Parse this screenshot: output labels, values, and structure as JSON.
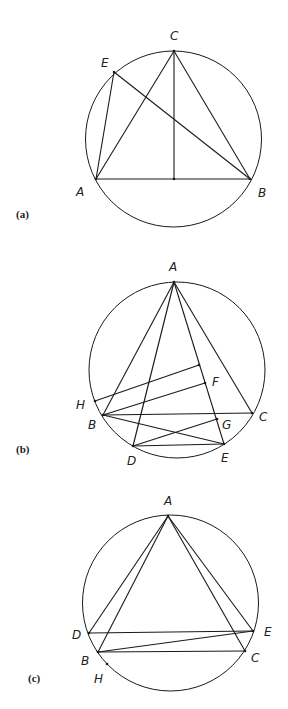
{
  "panels": [
    {
      "caption": "(a)",
      "circle": {
        "cx": 173.5,
        "cy": 139,
        "r": 88
      },
      "points": {
        "A": [
          96,
          179
        ],
        "B": [
          250,
          179
        ],
        "C": [
          174,
          51
        ],
        "E": [
          114,
          72
        ],
        "F": [
          174,
          179
        ]
      },
      "labels": [
        {
          "text": "C",
          "x": 170,
          "y": 40
        },
        {
          "text": "E",
          "x": 101,
          "y": 67
        },
        {
          "text": "A",
          "x": 76,
          "y": 196
        },
        {
          "text": "B",
          "x": 258,
          "y": 197
        }
      ],
      "segments": [
        [
          "A",
          "B"
        ],
        [
          "A",
          "C"
        ],
        [
          "B",
          "C"
        ],
        [
          "C",
          "F"
        ],
        [
          "A",
          "E"
        ],
        [
          "E",
          "B"
        ]
      ],
      "caption_pos": {
        "x": 16,
        "y": 218
      }
    },
    {
      "caption": "(b)",
      "circle": {
        "cx": 177,
        "cy": 370,
        "r": 88
      },
      "points": {
        "A": [
          174,
          282
        ],
        "B": [
          103,
          415
        ],
        "C": [
          252,
          413
        ],
        "D": [
          133,
          446
        ],
        "E": [
          224,
          444
        ],
        "H": [
          95,
          401
        ],
        "P": [
          199,
          365
        ],
        "F": [
          205,
          383
        ],
        "G": [
          217,
          419
        ]
      },
      "labels": [
        {
          "text": "A",
          "x": 169,
          "y": 271
        },
        {
          "text": "F",
          "x": 212,
          "y": 386
        },
        {
          "text": "H",
          "x": 76,
          "y": 409
        },
        {
          "text": "C",
          "x": 259,
          "y": 421
        },
        {
          "text": "B",
          "x": 88,
          "y": 429
        },
        {
          "text": "G",
          "x": 222,
          "y": 429
        },
        {
          "text": "D",
          "x": 127,
          "y": 465
        },
        {
          "text": "E",
          "x": 221,
          "y": 462
        }
      ],
      "segments": [
        [
          "A",
          "B"
        ],
        [
          "A",
          "C"
        ],
        [
          "A",
          "D"
        ],
        [
          "A",
          "E"
        ],
        [
          "B",
          "C"
        ],
        [
          "D",
          "E"
        ],
        [
          "B",
          "E"
        ],
        [
          "D",
          "G"
        ],
        [
          "H",
          "P"
        ],
        [
          "B",
          "F"
        ]
      ],
      "caption_pos": {
        "x": 16,
        "y": 453
      }
    },
    {
      "caption": "(c)",
      "circle": {
        "cx": 170.5,
        "cy": 603,
        "r": 88
      },
      "points": {
        "A": [
          168,
          516
        ],
        "D": [
          89,
          633
        ],
        "E": [
          253,
          631
        ],
        "B": [
          98,
          652
        ],
        "C": [
          245,
          651
        ],
        "H": [
          107,
          664
        ]
      },
      "labels": [
        {
          "text": "A",
          "x": 164,
          "y": 505
        },
        {
          "text": "D",
          "x": 72,
          "y": 639
        },
        {
          "text": "E",
          "x": 264,
          "y": 636
        },
        {
          "text": "B",
          "x": 81,
          "y": 665
        },
        {
          "text": "C",
          "x": 251,
          "y": 662
        },
        {
          "text": "H",
          "x": 94,
          "y": 683
        }
      ],
      "segments": [
        [
          "A",
          "D"
        ],
        [
          "A",
          "B"
        ],
        [
          "A",
          "C"
        ],
        [
          "A",
          "E"
        ],
        [
          "D",
          "E"
        ],
        [
          "B",
          "C"
        ],
        [
          "B",
          "E"
        ]
      ],
      "caption_pos": {
        "x": 28,
        "y": 682
      }
    }
  ]
}
